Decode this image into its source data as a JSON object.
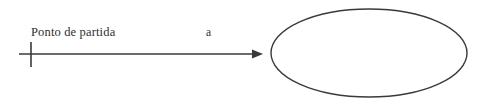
{
  "diagram": {
    "type": "directed-graph-fragment",
    "background_color": "#ffffff",
    "stroke_color": "#3a3a3a",
    "text_color": "#2f2f2f",
    "labels": {
      "start_point": "Ponto de partida",
      "edge": "a"
    },
    "shapes": {
      "start_tick": {
        "name": "start-point-tick",
        "x": 31,
        "y_top": 42,
        "y_bottom": 67
      },
      "arrow": {
        "name": "transition-arrow",
        "x_start": 19,
        "x_end": 263,
        "y": 54,
        "head_length": 11,
        "head_width": 8
      },
      "ellipse": {
        "name": "state-ellipse",
        "cx": 369,
        "cy": 53,
        "rx": 98,
        "ry": 44,
        "fill": "none"
      }
    }
  }
}
